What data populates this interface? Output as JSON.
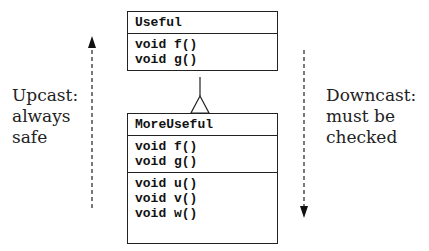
{
  "diagram": {
    "classes": [
      {
        "name": "Useful",
        "methods": [
          [
            "void f()",
            "void g()"
          ]
        ]
      },
      {
        "name": "MoreUseful",
        "methods": [
          [
            "void f()",
            "void g()"
          ],
          [
            "void u()",
            "void v()",
            "void w()"
          ]
        ]
      }
    ],
    "relationship": "inheritance",
    "left_label": {
      "lines": [
        "Upcast:",
        "always",
        "safe"
      ],
      "direction": "up"
    },
    "right_label": {
      "lines": [
        "Downcast:",
        "must be",
        "checked"
      ],
      "direction": "down"
    }
  }
}
